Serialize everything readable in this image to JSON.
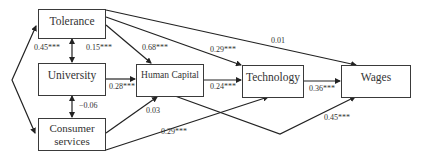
{
  "nodes": {
    "tolerance": "Tolerance",
    "university": "University",
    "consumer_services_line1": "Consumer",
    "consumer_services_line2": "services",
    "human_capital": "Human Capital",
    "technology": "Technology",
    "wages": "Wages"
  },
  "paths": [
    {
      "from": "Tolerance",
      "to": "University",
      "type": "correlation",
      "label": "0.45***"
    },
    {
      "from": "Tolerance",
      "to": "University",
      "type": "correlation-secondary",
      "label": "0.15***"
    },
    {
      "from": "University",
      "to": "Consumer services",
      "type": "correlation",
      "label": "-0.06"
    },
    {
      "from": "Tolerance",
      "to": "Human Capital",
      "label": "0.68***"
    },
    {
      "from": "Tolerance",
      "to": "Technology",
      "label": "0.29***"
    },
    {
      "from": "Tolerance",
      "to": "Wages",
      "label": "0.01"
    },
    {
      "from": "University",
      "to": "Human Capital",
      "label": "0.28***"
    },
    {
      "from": "Consumer services",
      "to": "Human Capital",
      "label": "0.03"
    },
    {
      "from": "Consumer services",
      "to": "Technology",
      "label": "0.29***"
    },
    {
      "from": "Human Capital",
      "to": "Technology",
      "label": "0.24***"
    },
    {
      "from": "Technology",
      "to": "Wages",
      "label": "0.36***"
    },
    {
      "from": "Human Capital",
      "to": "Wages",
      "label": "0.45***"
    }
  ],
  "labels": {
    "tol_uni_left": "0.45***",
    "tol_uni_right": "0.15***",
    "uni_cons": "−0.06",
    "tol_hc": "0.68***",
    "tol_tech": "0.29***",
    "tol_wages": "0.01",
    "uni_hc": "0.28***",
    "cons_hc": "0.03",
    "cons_tech": "0.29***",
    "hc_tech": "0.24***",
    "tech_wages": "0.36***",
    "hc_wages": "0.45***"
  },
  "colors": {
    "line": "#222222",
    "box_border": "#3a3a3a",
    "text": "#333333"
  }
}
